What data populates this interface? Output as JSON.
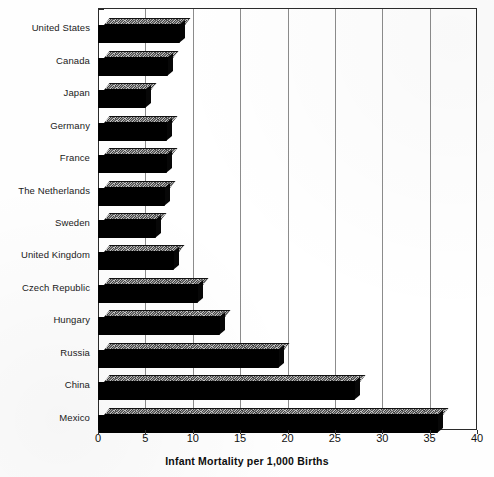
{
  "chart_data": {
    "type": "bar",
    "orientation": "horizontal",
    "title": "",
    "xlabel": "Infant Mortality per 1,000 Births",
    "ylabel": "",
    "xlim": [
      0,
      40
    ],
    "xticks": [
      0,
      5,
      10,
      15,
      20,
      25,
      30,
      35,
      40
    ],
    "xtick_labels": [
      "0",
      "5",
      "10",
      "15",
      "20",
      "25",
      "30",
      "35",
      "40"
    ],
    "grid": "vertical",
    "legend": "none",
    "style": "3d-bars-grayscale",
    "categories": [
      "United States",
      "Canada",
      "Japan",
      "Germany",
      "France",
      "The Netherlands",
      "Sweden",
      "United Kingdom",
      "Czech Republic",
      "Hungary",
      "Russia",
      "China",
      "Mexico"
    ],
    "values": [
      8.5,
      7.3,
      5.0,
      7.2,
      7.2,
      7.0,
      6.0,
      7.9,
      10.5,
      12.8,
      19.0,
      27.0,
      35.8
    ],
    "series": [
      {
        "name": "Infant Mortality per 1,000 Births",
        "values": [
          8.5,
          7.3,
          5.0,
          7.2,
          7.2,
          7.0,
          6.0,
          7.9,
          10.5,
          12.8,
          19.0,
          27.0,
          35.8
        ]
      }
    ]
  },
  "colors": {
    "bar_front": "#000000",
    "bar_top": "#6f6f6f",
    "axis": "#2b2b2b",
    "gridline": "#8c8c8c",
    "text": "#111111",
    "background": "#ffffff"
  }
}
